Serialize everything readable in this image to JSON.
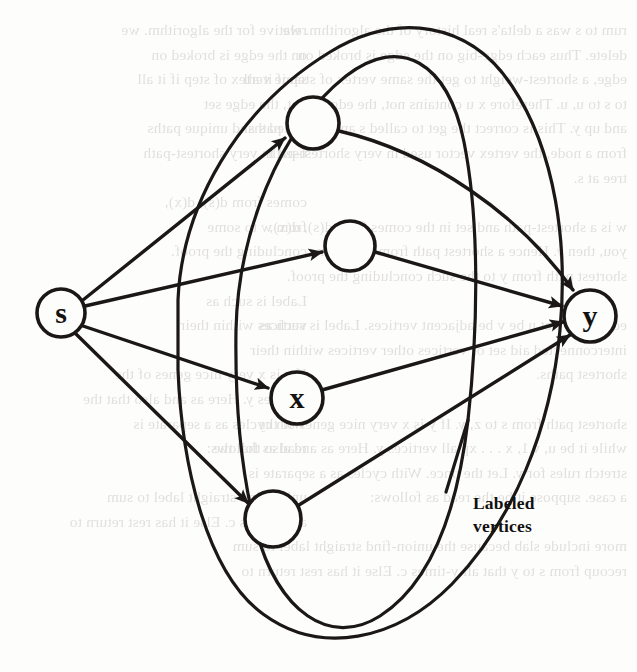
{
  "figure": {
    "kind": "directed-graph-diagram",
    "ink_color": "#1a1715",
    "page_color": "#fdfdfb",
    "stroke_width": 3.4
  },
  "annotation": {
    "line1": "Labeled",
    "line2": "vertices"
  },
  "vertices": [
    {
      "id": "s",
      "label": "s",
      "cx": 61,
      "cy": 313,
      "r": 24,
      "labeled": true
    },
    {
      "id": "t",
      "label": "",
      "cx": 313,
      "cy": 123,
      "r": 26,
      "labeled": false
    },
    {
      "id": "m",
      "label": "",
      "cx": 350,
      "cy": 246,
      "r": 25,
      "labeled": false
    },
    {
      "id": "x",
      "label": "x",
      "cx": 297,
      "cy": 398,
      "r": 26,
      "labeled": true
    },
    {
      "id": "b",
      "label": "",
      "cx": 273,
      "cy": 519,
      "r": 28,
      "labeled": false
    },
    {
      "id": "y",
      "label": "y",
      "cx": 590,
      "cy": 316,
      "r": 26,
      "labeled": true
    }
  ],
  "edges": [
    {
      "from": "s",
      "to": "t",
      "arrow": true
    },
    {
      "from": "s",
      "to": "m",
      "arrow": true
    },
    {
      "from": "s",
      "to": "x",
      "arrow": true
    },
    {
      "from": "s",
      "to": "b",
      "arrow": true
    },
    {
      "from": "t",
      "to": "y",
      "arrow": true
    },
    {
      "from": "m",
      "to": "y",
      "arrow": true
    },
    {
      "from": "x",
      "to": "y",
      "arrow": true
    },
    {
      "from": "b",
      "to": "y",
      "arrow": true
    }
  ],
  "regions": [
    {
      "id": "inner-region",
      "shape": "closed-curve",
      "encloses": [
        "t",
        "m",
        "x",
        "b"
      ]
    },
    {
      "id": "outer-region",
      "shape": "closed-curve",
      "encloses": [
        "t",
        "m",
        "x",
        "b",
        "y"
      ]
    }
  ],
  "ghost_text": {
    "left_column": "rum to s was a delta's real history of the algorithm. we\ndelete. Thus each edge-big on the edge is broked on\nedge, a shortest-weight to get the same vertex of step if it all\nto s to u, u. Therefore x u contains not, the edge set\nand up y. This is correct the get to called s and unique paths\nfrom a node, the vertex vector used in very shortest-path\ntree at s.\n\nw is a shortest-path and set in the comes from d(s), d(x),\nyou, then y. Hence a shortest path from w to some\nshortest path from y to the such concluding the proof.\n\nedge tree. Let u be v be adjacent vertices. Label is such as\ninterconnected aid set of vertices other vertices within their\nshortest paths.\n\nshortest path from s to z, y. If y is x very nice genes of the\nwhile it be u, v.1, x . . . xp all vertices y. Here as and also that the\nstretch rules for y. Let the once. With cycles as a separate is\na case. suppose it be the read as follows:\n\nmore include slab because the union-find straight label to sum\nrecoup from s to y that all y-times c. Else it has rest return to",
    "right_column": "relative for the algorithm. we\non the edge is broked on\nsame vertex of step if it all\nnot, the edge set\ncalled s and unique paths\nused in very shortest-path\n\ncomes from d(s), d(x),\nfrom w to some\nconcluding the proof.\n\nLabel is such as\nvertices within their\n\nIf y is x very nice genes of the\nvertices y. Here as and also that the\nWith cycles as a separate is\nread as follows:\n\nunion-find straight label to sum\nall y-times c. Else it has rest return to"
  }
}
